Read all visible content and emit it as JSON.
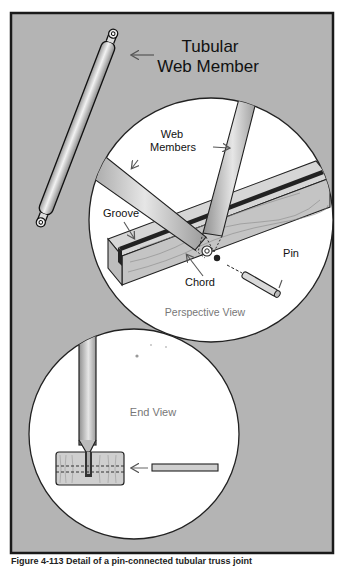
{
  "figure": {
    "labels": {
      "tubular_line1": "Tubular",
      "tubular_line2": "Web Member",
      "web_line1": "Web",
      "web_line2": "Members",
      "groove": "Groove",
      "chord": "Chord",
      "pin": "Pin",
      "perspective_view": "Perspective View",
      "end_view": "End View"
    },
    "caption": "Figure 4-113 Detail of a pin-connected tubular truss joint"
  },
  "colors": {
    "background_panel": "#b4b4b4",
    "frame": "#1a1a1a",
    "circle_fill": "#ffffff",
    "wood": "#c9c9c9",
    "groove": "#222222",
    "tube_light": "#e8e8e8",
    "tube_dark": "#8a8a8a",
    "label_text": "#111111",
    "view_label_text": "#777777"
  }
}
